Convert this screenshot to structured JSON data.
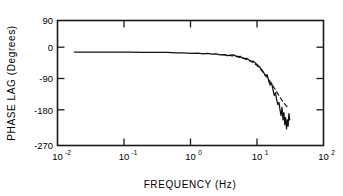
{
  "chart_data": {
    "type": "line",
    "title": "",
    "xlabel": "FREQUENCY (Hz)",
    "ylabel": "PHASE LAG (Degrees)",
    "xscale": "log",
    "yscale": "linear",
    "xlim": [
      0.01,
      100
    ],
    "ylim": [
      -270,
      90
    ],
    "grid": false,
    "legend": null,
    "xticks": [
      0.01,
      0.1,
      1,
      10,
      100
    ],
    "xtick_labels": [
      "10",
      "10",
      "10",
      "10",
      "10"
    ],
    "xtick_exponents": [
      "-2",
      "-1",
      "0",
      "1",
      "2"
    ],
    "yticks": [
      90,
      0,
      -90,
      -180,
      -270
    ],
    "ytick_labels": [
      "90",
      "0",
      "-90",
      "-180",
      "-270"
    ],
    "series": [
      {
        "name": "measured phase lag",
        "style": "solid",
        "x": [
          0.018,
          0.03,
          0.05,
          0.08,
          0.12,
          0.2,
          0.3,
          0.45,
          0.6,
          0.75,
          0.9,
          1.1,
          1.3,
          1.55,
          1.8,
          2.1,
          2.4,
          2.8,
          3.2,
          3.6,
          4.0,
          4.4,
          4.8,
          5.2,
          5.6,
          6.0,
          6.5,
          7.0,
          7.6,
          8.2,
          8.8,
          9.5,
          10.2,
          11.0,
          11.8,
          12.6,
          13.4,
          14.2,
          15.0,
          15.8,
          16.6,
          17.4,
          18.2,
          19.0,
          19.8,
          20.6,
          21.4,
          22.2,
          23.0,
          23.8,
          24.6,
          25.4,
          26.2,
          27.0,
          27.8,
          28.6,
          29.4,
          30.2,
          31.0
        ],
        "y": [
          -1,
          -1,
          -1,
          -1,
          -1,
          -1.5,
          -2,
          -2,
          -3,
          -3,
          -4,
          -5,
          -4,
          -6,
          -5,
          -7,
          -6,
          -9,
          -8,
          -11,
          -10,
          -9,
          -12,
          -14,
          -13,
          -17,
          -20,
          -19,
          -24,
          -28,
          -27,
          -33,
          -38,
          -44,
          -52,
          -60,
          -70,
          -66,
          -84,
          -96,
          -90,
          -110,
          -126,
          -118,
          -140,
          -152,
          -146,
          -168,
          -184,
          -160,
          -196,
          -175,
          -210,
          -190,
          -222,
          -196,
          -214,
          -178,
          -196
        ]
      },
      {
        "name": "model fit",
        "style": "dashed",
        "x": [
          3.0,
          4.0,
          5.0,
          6.0,
          7.0,
          8.0,
          9.0,
          10.0,
          11.0,
          12.5,
          14.0,
          16.0,
          18.0,
          20.0,
          22.0,
          24.0,
          26.0,
          28.0,
          30.0
        ],
        "y": [
          -8,
          -11,
          -14,
          -18,
          -22,
          -27,
          -33,
          -40,
          -48,
          -60,
          -72,
          -88,
          -103,
          -117,
          -130,
          -141,
          -150,
          -157,
          -163
        ]
      }
    ]
  },
  "axes": {
    "x_title": "FREQUENCY (Hz)",
    "y_title": "PHASE LAG (Degrees)"
  }
}
